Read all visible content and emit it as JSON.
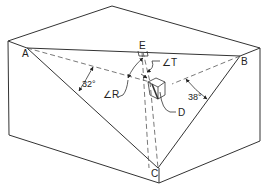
{
  "diagram": {
    "points": {
      "A": "A",
      "B": "B",
      "C": "C",
      "D": "D",
      "E": "E"
    },
    "angles": {
      "angle_A": "32°",
      "angle_B": "38°",
      "angle_R": "∠R",
      "angle_T": "∠T"
    },
    "colors": {
      "line": "#333333",
      "background": "#ffffff"
    }
  }
}
